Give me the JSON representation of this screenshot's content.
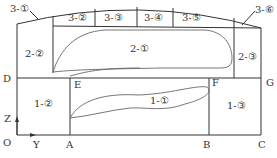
{
  "diagram": {
    "type": "mine-stope-zoning-schematic",
    "points": {
      "O": "O",
      "Y": "Y",
      "Z": "Z",
      "A": "A",
      "B": "B",
      "C": "C",
      "D": "D",
      "E": "E",
      "F": "F",
      "G": "G"
    },
    "zones": {
      "z1_1": "1-①",
      "z1_2": "1-②",
      "z1_3": "1-③",
      "z2_1": "2-①",
      "z2_2": "2-②",
      "z2_3": "2-③",
      "z3_1": "3-①",
      "z3_2": "3-②",
      "z3_3": "3-③",
      "z3_4": "3-④",
      "z3_5": "3-⑤",
      "z3_6": "3-⑥"
    },
    "colors": {
      "line": "#333333",
      "curve": "#666666",
      "background": "#ffffff"
    }
  }
}
